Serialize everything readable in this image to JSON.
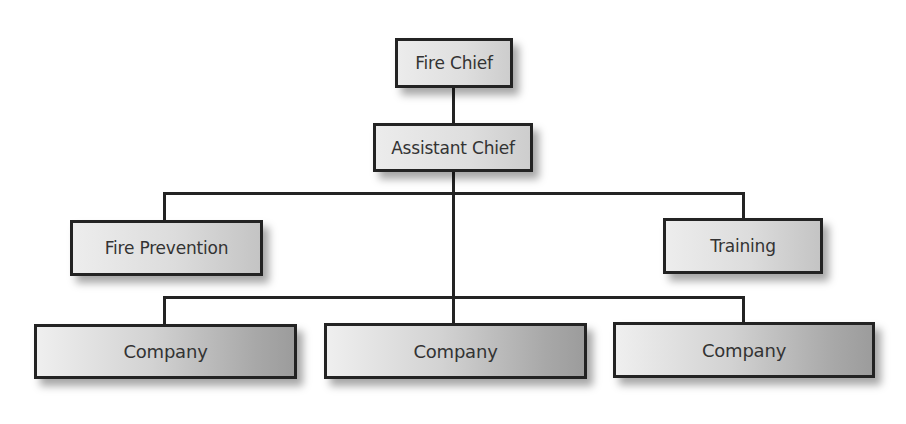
{
  "diagram": {
    "type": "org-chart",
    "nodes": {
      "fire_chief": {
        "label": "Fire Chief",
        "level": 0
      },
      "assistant_chief": {
        "label": "Assistant Chief",
        "level": 1,
        "reports_to": "Fire Chief"
      },
      "fire_prevention": {
        "label": "Fire Prevention",
        "level": 2,
        "reports_to": "Assistant Chief"
      },
      "training": {
        "label": "Training",
        "level": 2,
        "reports_to": "Assistant Chief"
      },
      "company_1": {
        "label": "Company",
        "level": 3,
        "reports_to": "Assistant Chief"
      },
      "company_2": {
        "label": "Company",
        "level": 3,
        "reports_to": "Assistant Chief"
      },
      "company_3": {
        "label": "Company",
        "level": 3,
        "reports_to": "Assistant Chief"
      }
    },
    "edges": [
      [
        "Fire Chief",
        "Assistant Chief"
      ],
      [
        "Assistant Chief",
        "Fire Prevention"
      ],
      [
        "Assistant Chief",
        "Training"
      ],
      [
        "Assistant Chief",
        "Company (left)"
      ],
      [
        "Assistant Chief",
        "Company (center)"
      ],
      [
        "Assistant Chief",
        "Company (right)"
      ]
    ],
    "colors": {
      "border": "#232323",
      "text": "#333333",
      "fill_light": "#ececec",
      "fill_dark": "#9c9c9c",
      "background": "#ffffff"
    }
  }
}
